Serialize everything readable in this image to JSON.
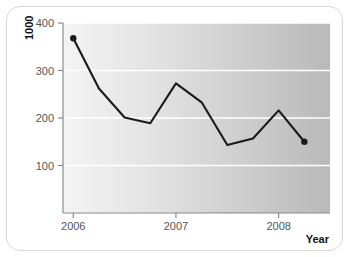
{
  "chart_data": {
    "type": "line",
    "title": "",
    "subtitle": "",
    "xlabel": "Year",
    "ylabel": "1000",
    "x": [
      2006.0,
      2006.25,
      2006.5,
      2006.75,
      2007.0,
      2007.25,
      2007.5,
      2007.75,
      2008.0,
      2008.25
    ],
    "values": [
      368,
      262,
      201,
      189,
      273,
      233,
      143,
      157,
      216,
      150
    ],
    "x_tick_labels": [
      "2006",
      "2007",
      "2008"
    ],
    "x_tick_values": [
      2006,
      2007,
      2008
    ],
    "y_tick_labels": [
      "100",
      "200",
      "300",
      "400"
    ],
    "y_tick_values": [
      100,
      200,
      300,
      400
    ],
    "xlim": [
      2005.9,
      2008.5
    ],
    "ylim": [
      0,
      400
    ],
    "grid": true,
    "grid_axis": "y",
    "legend": false,
    "legend_position": "none",
    "series": [
      {
        "name": "value",
        "values": [
          368,
          262,
          201,
          189,
          273,
          233,
          143,
          157,
          216,
          150
        ],
        "line_color": "#1a1a1a",
        "marker_endpoints_only": true
      }
    ],
    "annotations": []
  },
  "figure": {
    "plot_background_gradient_start": "#f1f1f1",
    "plot_background_gradient_end": "#b8b8b8",
    "gridline_color": "#ffffff",
    "axis_color": "#8a8a8a",
    "card_border_color": "#d8d8d8",
    "card_background": "#ffffff",
    "line_color": "#1a1a1a",
    "tick_label_color": "#555555"
  }
}
